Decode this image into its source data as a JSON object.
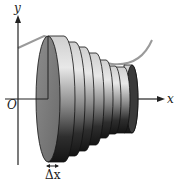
{
  "figure": {
    "axes": {
      "x_label": "x",
      "y_label": "y",
      "origin_label": "O"
    },
    "slice_width_label": "Δx",
    "disk_count": 8,
    "colors": {
      "curve": "#9a9a9a",
      "axes": "#222222",
      "disk_dark": "#1e1e1e",
      "disk_mid": "#6e6e6e",
      "disk_light": "#dcdcdc",
      "front_face": "#7d7d7d"
    }
  }
}
